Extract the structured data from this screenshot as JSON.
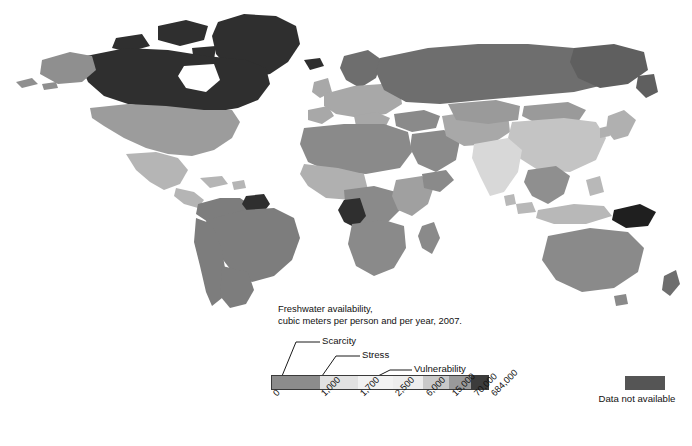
{
  "chart_data": {
    "type": "choropleth-map",
    "title": "Freshwater availability,\ncubic meters per person and per year, 2007.",
    "title_line1": "Freshwater availability,",
    "title_line2": "cubic meters per person and per year, 2007.",
    "units": "cubic meters per person and per year",
    "year": "2007",
    "legend_position": "bottom-center",
    "scale_type": "sequential-binned-gray",
    "tick_labels": [
      "0",
      "1,000",
      "1,700",
      "2,500",
      "6,000",
      "15,000",
      "70,000",
      "684,000"
    ],
    "tick_values": [
      0,
      1000,
      1700,
      2500,
      6000,
      15000,
      70000,
      684000
    ],
    "bins": [
      {
        "from": "0",
        "to": "1,000",
        "color": "#8c8c8c",
        "category": "Scarcity"
      },
      {
        "from": "1,000",
        "to": "1,700",
        "color": "#e2e2e2",
        "category": "Stress"
      },
      {
        "from": "1,700",
        "to": "2,500",
        "color": "#f2f2f2",
        "category": "Vulnerability"
      },
      {
        "from": "2,500",
        "to": "6,000",
        "color": "#ededed",
        "category": ""
      },
      {
        "from": "6,000",
        "to": "15,000",
        "color": "#c9c9c9",
        "category": ""
      },
      {
        "from": "15,000",
        "to": "70,000",
        "color": "#9a9a9a",
        "category": ""
      },
      {
        "from": "70,000",
        "to": "684,000",
        "color": "#3c3c3c",
        "category": ""
      }
    ],
    "callouts": [
      {
        "label": "Scarcity",
        "target_tick": "1,000"
      },
      {
        "label": "Stress",
        "target_tick": "1,700"
      },
      {
        "label": "Vulnerability",
        "target_tick": "2,500"
      }
    ],
    "no_data": {
      "label": "Data not available",
      "color": "#555555"
    },
    "background": "#ffffff",
    "regions": [
      {
        "name": "Canada",
        "shade": "#2f2f2f",
        "bin": "70,000-684,000"
      },
      {
        "name": "Greenland",
        "shade": "#2f2f2f",
        "bin": "70,000-684,000"
      },
      {
        "name": "Alaska",
        "shade": "#8f8f8f",
        "bin": "15,000-70,000"
      },
      {
        "name": "United States",
        "shade": "#9c9c9c",
        "bin": "6,000-15,000"
      },
      {
        "name": "Mexico",
        "shade": "#b5b5b5",
        "bin": "2,500-6,000"
      },
      {
        "name": "Brazil",
        "shade": "#7d7d7d",
        "bin": "15,000-70,000"
      },
      {
        "name": "Guyana-Suriname",
        "shade": "#2f2f2f",
        "bin": "70,000-684,000"
      },
      {
        "name": "Argentina",
        "shade": "#7d7d7d",
        "bin": "15,000-70,000"
      },
      {
        "name": "Russia",
        "shade": "#6e6e6e",
        "bin": "15,000-70,000"
      },
      {
        "name": "Europe",
        "shade": "#a8a8a8",
        "bin": "2,500-6,000"
      },
      {
        "name": "North Africa",
        "shade": "#8a8a8a",
        "bin": "0-1,000"
      },
      {
        "name": "Middle East",
        "shade": "#8a8a8a",
        "bin": "0-1,000"
      },
      {
        "name": "Central Africa",
        "shade": "#8a8a8a",
        "bin": "6,000-15,000"
      },
      {
        "name": "Gabon-Congo",
        "shade": "#2f2f2f",
        "bin": "70,000-684,000"
      },
      {
        "name": "India",
        "shade": "#d8d8d8",
        "bin": "1,000-1,700"
      },
      {
        "name": "China",
        "shade": "#c4c4c4",
        "bin": "1,700-2,500"
      },
      {
        "name": "Southeast Asia",
        "shade": "#8f8f8f",
        "bin": "6,000-15,000"
      },
      {
        "name": "Papua New Guinea",
        "shade": "#1f1f1f",
        "bin": "70,000-684,000"
      },
      {
        "name": "Australia",
        "shade": "#8a8a8a",
        "bin": "15,000-70,000"
      },
      {
        "name": "New Zealand",
        "shade": "#6e6e6e",
        "bin": "70,000-684,000"
      },
      {
        "name": "Madagascar",
        "shade": "#8a8a8a",
        "bin": "15,000-70,000"
      },
      {
        "name": "Japan",
        "shade": "#b0b0b0",
        "bin": "2,500-6,000"
      }
    ]
  },
  "legend": {
    "title_line1": "Freshwater availability,",
    "title_line2": "cubic meters per person and per year, 2007.",
    "scarcity": "Scarcity",
    "stress": "Stress",
    "vulnerability": "Vulnerability",
    "no_data_label": "Data not available"
  }
}
